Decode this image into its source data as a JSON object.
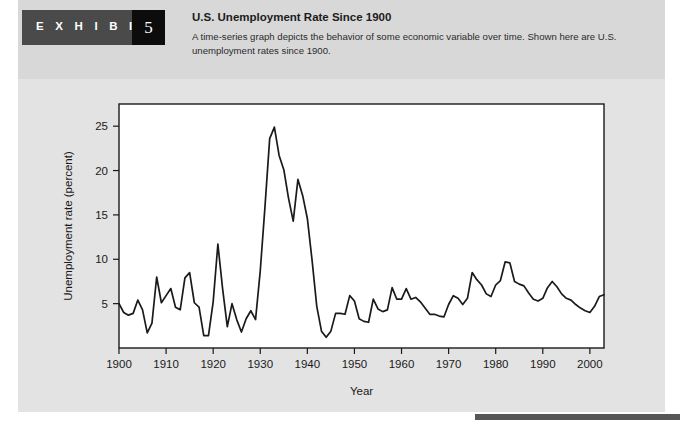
{
  "exhibit": {
    "label": "E X H I B I T",
    "number": "5"
  },
  "header": {
    "title": "U.S. Unemployment Rate Since 1900",
    "description": "A time-series graph depicts the behavior of some economic variable over time. Shown here are U.S. unemployment rates since 1900."
  },
  "colors": {
    "page_background": "#ffffff",
    "panel_background": "#e3e3e3",
    "header_band": "#d8d8d8",
    "exhibit_block": "#4a4a4a",
    "exhibit_number_block": "#0c0c0c",
    "plot_background": "#ffffff",
    "line": "#1a1a1a",
    "axis": "#1a1a1a",
    "footer_rule": "#575757"
  },
  "chart_data": {
    "type": "line",
    "title": "U.S. Unemployment Rate Since 1900",
    "xlabel": "Year",
    "ylabel": "Unemployment rate (percent)",
    "xlim": [
      1900,
      2003
    ],
    "ylim": [
      0,
      27.5
    ],
    "grid": false,
    "legend": null,
    "xticks": [
      1900,
      1910,
      1920,
      1930,
      1940,
      1950,
      1960,
      1970,
      1980,
      1990,
      2000
    ],
    "xtick_labels": [
      "1900",
      "1910",
      "1920",
      "1930",
      "1940",
      "1950",
      "1960",
      "1970",
      "1980",
      "1990",
      "2000"
    ],
    "yticks": [
      5,
      10,
      15,
      20,
      25
    ],
    "ytick_labels": [
      "5",
      "10",
      "15",
      "20",
      "25"
    ],
    "series": [
      {
        "name": "U.S. unemployment rate",
        "x": [
          1900,
          1901,
          1902,
          1903,
          1904,
          1905,
          1906,
          1907,
          1908,
          1909,
          1910,
          1911,
          1912,
          1913,
          1914,
          1915,
          1916,
          1917,
          1918,
          1919,
          1920,
          1921,
          1922,
          1923,
          1924,
          1925,
          1926,
          1927,
          1928,
          1929,
          1930,
          1931,
          1932,
          1933,
          1934,
          1935,
          1936,
          1937,
          1938,
          1939,
          1940,
          1941,
          1942,
          1943,
          1944,
          1945,
          1946,
          1947,
          1948,
          1949,
          1950,
          1951,
          1952,
          1953,
          1954,
          1955,
          1956,
          1957,
          1958,
          1959,
          1960,
          1961,
          1962,
          1963,
          1964,
          1965,
          1966,
          1967,
          1968,
          1969,
          1970,
          1971,
          1972,
          1973,
          1974,
          1975,
          1976,
          1977,
          1978,
          1979,
          1980,
          1981,
          1982,
          1983,
          1984,
          1985,
          1986,
          1987,
          1988,
          1989,
          1990,
          1991,
          1992,
          1993,
          1994,
          1995,
          1996,
          1997,
          1998,
          1999,
          2000,
          2001,
          2002,
          2003
        ],
        "values": [
          5.0,
          4.0,
          3.7,
          3.9,
          5.4,
          4.3,
          1.7,
          2.8,
          8.0,
          5.1,
          5.9,
          6.7,
          4.6,
          4.3,
          7.9,
          8.5,
          5.1,
          4.6,
          1.4,
          1.4,
          5.2,
          11.7,
          6.7,
          2.4,
          5.0,
          3.2,
          1.8,
          3.3,
          4.2,
          3.2,
          8.7,
          15.9,
          23.6,
          24.9,
          21.7,
          20.1,
          16.9,
          14.3,
          19.0,
          17.2,
          14.6,
          9.9,
          4.7,
          1.9,
          1.2,
          1.9,
          3.9,
          3.9,
          3.8,
          5.9,
          5.3,
          3.3,
          3.0,
          2.9,
          5.5,
          4.4,
          4.1,
          4.3,
          6.8,
          5.5,
          5.5,
          6.7,
          5.5,
          5.7,
          5.2,
          4.5,
          3.8,
          3.8,
          3.6,
          3.5,
          4.9,
          5.9,
          5.6,
          4.9,
          5.6,
          8.5,
          7.7,
          7.1,
          6.1,
          5.8,
          7.1,
          7.6,
          9.7,
          9.6,
          7.5,
          7.2,
          7.0,
          6.2,
          5.5,
          5.3,
          5.6,
          6.8,
          7.5,
          6.9,
          6.1,
          5.6,
          5.4,
          4.9,
          4.5,
          4.2,
          4.0,
          4.7,
          5.8,
          6.0
        ]
      }
    ]
  }
}
